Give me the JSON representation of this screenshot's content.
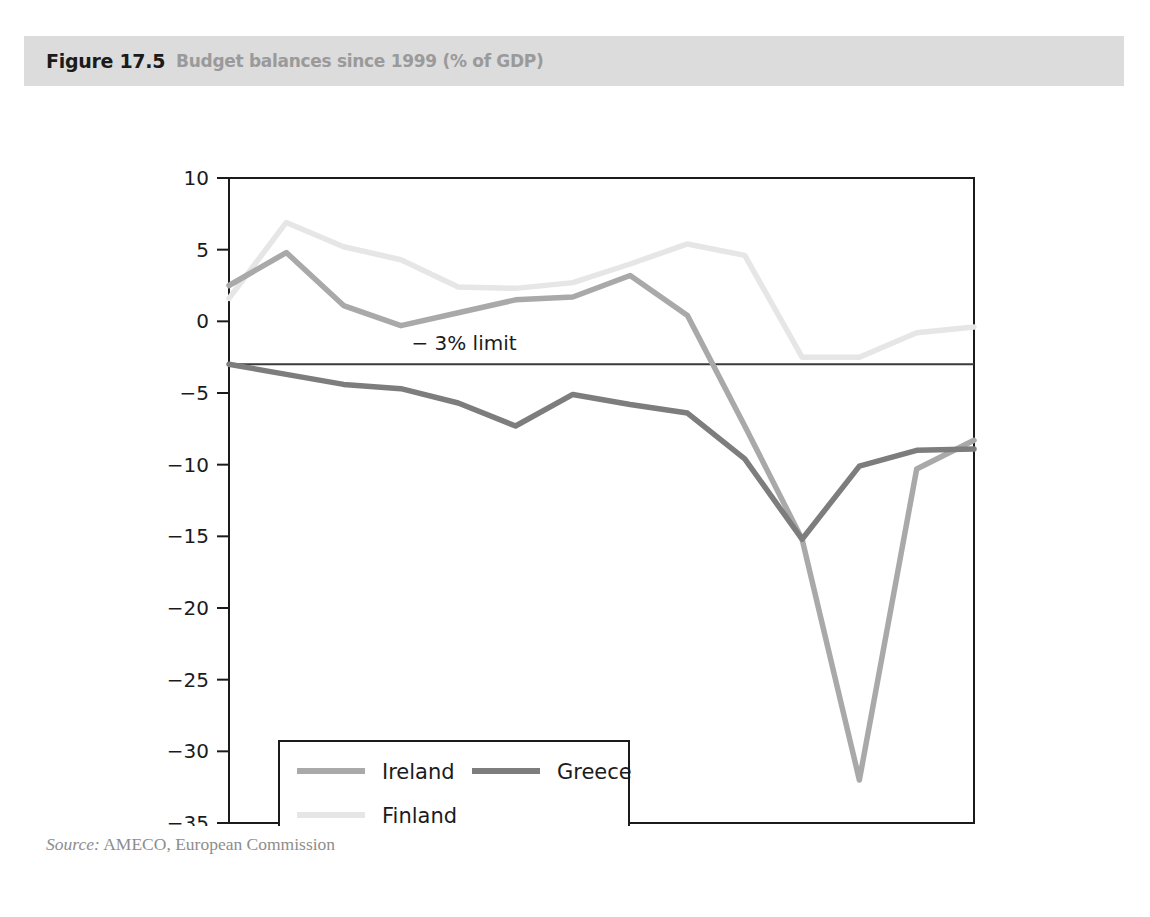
{
  "figure": {
    "number": "Figure 17.5",
    "caption": "Budget balances since 1999 (% of GDP)",
    "source_prefix": "Source:",
    "source_text": "AMECO, European Commission"
  },
  "chart_data": {
    "type": "line",
    "title": "Budget balances since 1999 (% of GDP)",
    "xlabel": "",
    "ylabel": "",
    "categories": [
      "1999",
      "2000",
      "2001",
      "2002",
      "2003",
      "2004",
      "2005",
      "2006",
      "2007",
      "2008",
      "2009",
      "2010",
      "2011",
      "2012"
    ],
    "x": [
      1999,
      2000,
      2001,
      2002,
      2003,
      2004,
      2005,
      2006,
      2007,
      2008,
      2009,
      2010,
      2011,
      2012
    ],
    "xlim": [
      1999,
      2012
    ],
    "ylim": [
      -35,
      10
    ],
    "yticks": [
      "10",
      "5",
      "0",
      "−5",
      "−10",
      "−15",
      "−20",
      "−25",
      "−30",
      "−35"
    ],
    "ytick_values": [
      10,
      5,
      0,
      -5,
      -10,
      -15,
      -20,
      -25,
      -30,
      -35
    ],
    "grid": false,
    "legend_position": "bottom-left",
    "series": [
      {
        "name": "Ireland",
        "color": "#a9a9a9",
        "values": [
          2.5,
          4.8,
          1.1,
          -0.3,
          0.6,
          1.5,
          1.7,
          3.2,
          0.4,
          -7.3,
          -15.2,
          -32.0,
          -10.3,
          -8.3
        ]
      },
      {
        "name": "Greece",
        "color": "#7d7d7d",
        "values": [
          -3.0,
          -3.7,
          -4.4,
          -4.7,
          -5.7,
          -7.3,
          -5.1,
          -5.8,
          -6.4,
          -9.6,
          -15.2,
          -10.1,
          -9.0,
          -8.9
        ]
      },
      {
        "name": "Finland",
        "color": "#e6e6e6",
        "values": [
          1.6,
          6.9,
          5.2,
          4.3,
          2.4,
          2.3,
          2.7,
          4.0,
          5.4,
          4.6,
          -2.5,
          -2.5,
          -0.8,
          -0.4
        ]
      }
    ],
    "annotations": [
      {
        "name": "deficit-limit",
        "label": "− 3% limit",
        "y_value": -3,
        "type": "horizontal-line"
      }
    ]
  },
  "colors": {
    "header_band": "#dcdcdc",
    "figure_number": "#1b1b1b",
    "figure_caption": "#9a9a9a",
    "axis": "#1b1b1b",
    "source": "#8d8d8d"
  }
}
